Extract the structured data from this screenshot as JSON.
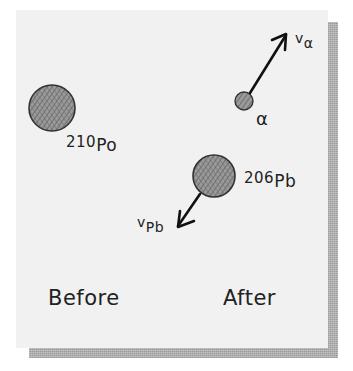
{
  "diagram": {
    "colors": {
      "panel_bg": "#f1f1f1",
      "shadow": "#b4b4b4",
      "ink": "#222222",
      "nucleus_fill": "#8a8a8a"
    },
    "before": {
      "caption": "Before",
      "nucleus": {
        "mass_number": "210",
        "symbol": "Po"
      }
    },
    "after": {
      "caption": "After",
      "alpha": {
        "label": "α",
        "velocity_label": "v",
        "velocity_sub": "α",
        "direction": "up-right"
      },
      "daughter": {
        "mass_number": "206",
        "symbol": "Pb",
        "velocity_label": "v",
        "velocity_sub": "Pb",
        "direction": "down-left"
      }
    }
  }
}
